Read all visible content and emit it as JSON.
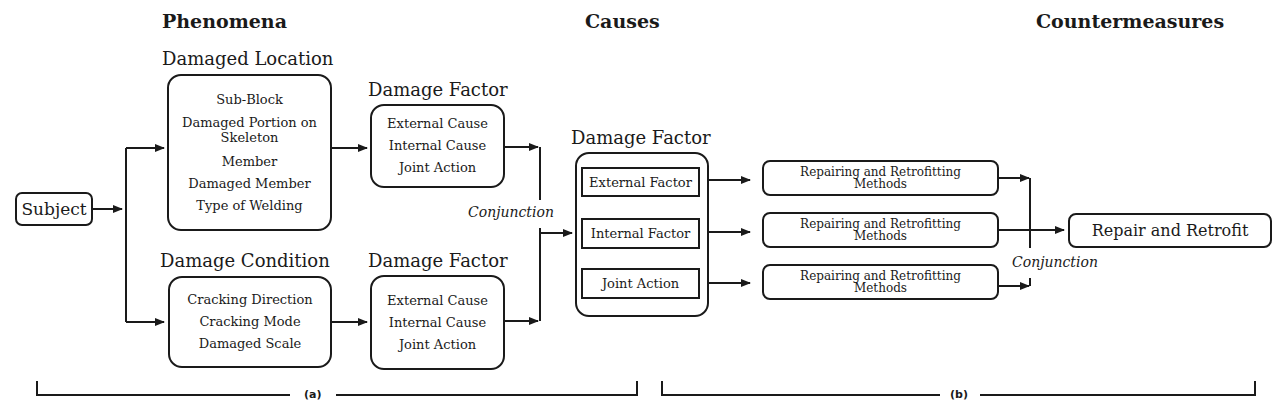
{
  "sections": {
    "phenomena": "Phenomena",
    "causes": "Causes",
    "countermeasures": "Countermeasures"
  },
  "subject": "Subject",
  "damaged_location": {
    "title": "Damaged Location",
    "items": [
      "Sub-Block",
      "Damaged Portion on",
      "Skeleton",
      "Member",
      "Damaged Member",
      "Type of Welding"
    ]
  },
  "damage_condition": {
    "title": "Damage Condition",
    "items": [
      "Cracking Direction",
      "Cracking Mode",
      "Damaged Scale"
    ]
  },
  "damage_factor_top": {
    "title": "Damage Factor",
    "items": [
      "External Cause",
      "Internal Cause",
      "Joint Action"
    ]
  },
  "damage_factor_bottom": {
    "title": "Damage Factor",
    "items": [
      "External Cause",
      "Internal Cause",
      "Joint Action"
    ]
  },
  "conjunction_left": "Conjunction",
  "damage_factor_causes": {
    "title": "Damage Factor",
    "items": [
      "External Factor",
      "Internal Factor",
      "Joint Action"
    ]
  },
  "methods": [
    {
      "line1": "Repairing and Retrofitting",
      "line2": "Methods"
    },
    {
      "line1": "Repairing and Retrofitting",
      "line2": "Methods"
    },
    {
      "line1": "Repairing and Retrofitting",
      "line2": "Methods"
    }
  ],
  "conjunction_right": "Conjunction",
  "result": "Repair and Retrofit",
  "brackets": {
    "a": "(a)",
    "b": "(b)"
  }
}
